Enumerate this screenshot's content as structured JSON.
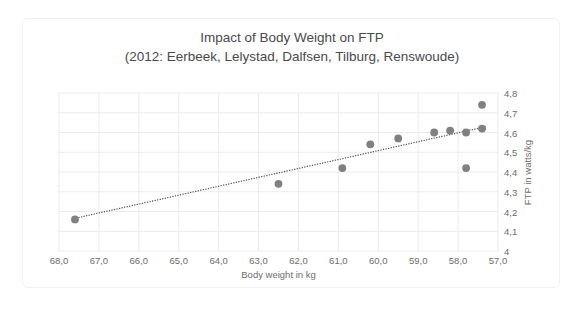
{
  "chart_data": {
    "type": "scatter",
    "title": "Impact of Body Weight on FTP",
    "subtitle": "(2012: Eerbeek, Lelystad, Dalfsen, Tilburg, Renswoude)",
    "xlabel": "Body weight in kg",
    "ylabel": "FTP in watts/kg",
    "xlim": [
      68.0,
      57.0
    ],
    "ylim": [
      4.0,
      4.8
    ],
    "x_axis_reversed": true,
    "grid": true,
    "legend": "none",
    "xticks": [
      "68,0",
      "67,0",
      "66,0",
      "65,0",
      "64,0",
      "63,0",
      "62,0",
      "61,0",
      "60,0",
      "59,0",
      "58,0",
      "57,0"
    ],
    "xtick_values": [
      68.0,
      67.0,
      66.0,
      65.0,
      64.0,
      63.0,
      62.0,
      61.0,
      60.0,
      59.0,
      58.0,
      57.0
    ],
    "yticks": [
      "4,8",
      "4,7",
      "4,6",
      "4,5",
      "4,4",
      "4,3",
      "4,2",
      "4,1",
      "4"
    ],
    "ytick_values": [
      4.8,
      4.7,
      4.6,
      4.5,
      4.4,
      4.3,
      4.2,
      4.1,
      4.0
    ],
    "marker_color": "#808080",
    "trendline_color": "#595959",
    "gridline_color": "#e8ecf0",
    "points": [
      {
        "x": 67.6,
        "y": 4.16
      },
      {
        "x": 62.5,
        "y": 4.34
      },
      {
        "x": 60.9,
        "y": 4.42
      },
      {
        "x": 60.2,
        "y": 4.54
      },
      {
        "x": 59.5,
        "y": 4.57
      },
      {
        "x": 58.6,
        "y": 4.6
      },
      {
        "x": 58.2,
        "y": 4.61
      },
      {
        "x": 57.8,
        "y": 4.6
      },
      {
        "x": 57.8,
        "y": 4.42
      },
      {
        "x": 57.4,
        "y": 4.74
      },
      {
        "x": 57.4,
        "y": 4.62
      }
    ],
    "trendline": {
      "x0": 67.5,
      "y0": 4.17,
      "x1": 57.3,
      "y1": 4.63,
      "style": "dotted"
    }
  }
}
